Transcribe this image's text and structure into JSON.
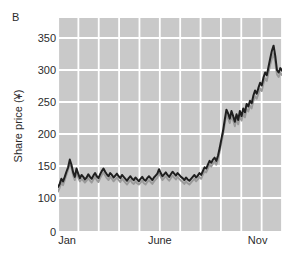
{
  "figure": {
    "panel_label": "B"
  },
  "chart_data": {
    "type": "line",
    "title": "",
    "subtitle": "",
    "xlabel": "",
    "ylabel": "Share price (¥)",
    "currency_symbol": "¥",
    "grid": true,
    "legend": "none",
    "plot_background_color": "#c9c9c9",
    "gridline_color": "#ffffff",
    "axis_text_color": "#2b2b2b",
    "ylim": [
      0,
      370
    ],
    "y_axis_broken": true,
    "y_break_note": "axis jumps from 0 to 100; ticks above 100 are evenly spaced by 50",
    "yticks": [
      0,
      100,
      150,
      200,
      250,
      300,
      350
    ],
    "ytick_labels": [
      "0",
      "100",
      "150",
      "200",
      "250",
      "300",
      "350"
    ],
    "xticks": [
      0,
      5,
      10
    ],
    "xtick_labels": [
      "Jan",
      "June",
      "Nov"
    ],
    "x_axis_unit": "month",
    "x_gridline_count": 11,
    "series": [
      {
        "name": "series-dark",
        "color": "#1f1f1f",
        "values": [
          117,
          122,
          130,
          126,
          133,
          141,
          148,
          160,
          152,
          140,
          133,
          146,
          138,
          131,
          136,
          133,
          129,
          132,
          137,
          133,
          130,
          135,
          139,
          134,
          131,
          137,
          142,
          146,
          141,
          137,
          134,
          139,
          136,
          132,
          135,
          138,
          134,
          131,
          136,
          133,
          130,
          127,
          131,
          134,
          130,
          128,
          132,
          129,
          126,
          130,
          133,
          129,
          127,
          131,
          134,
          131,
          128,
          132,
          135,
          138,
          145,
          139,
          134,
          137,
          140,
          136,
          133,
          137,
          141,
          138,
          135,
          139,
          136,
          133,
          131,
          128,
          132,
          129,
          127,
          130,
          133,
          136,
          132,
          135,
          139,
          136,
          142,
          148,
          146,
          152,
          158,
          155,
          160,
          163,
          158,
          166,
          178,
          192,
          205,
          222,
          238,
          232,
          224,
          236,
          228,
          219,
          231,
          222,
          236,
          228,
          240,
          234,
          247,
          243,
          252,
          248,
          260,
          268,
          263,
          272,
          280,
          276,
          288,
          296,
          292,
          305,
          318,
          330,
          338,
          322,
          300,
          296,
          303,
          299
        ]
      },
      {
        "name": "series-light",
        "color": "#9a9a9a",
        "values": [
          110,
          116,
          124,
          120,
          128,
          136,
          144,
          155,
          147,
          135,
          128,
          140,
          132,
          126,
          130,
          127,
          124,
          127,
          131,
          127,
          124,
          129,
          133,
          128,
          125,
          131,
          136,
          140,
          135,
          131,
          128,
          133,
          130,
          126,
          129,
          132,
          128,
          125,
          130,
          127,
          124,
          121,
          125,
          128,
          124,
          122,
          126,
          123,
          121,
          124,
          127,
          123,
          121,
          125,
          128,
          125,
          122,
          126,
          129,
          132,
          139,
          133,
          128,
          131,
          134,
          130,
          127,
          131,
          135,
          132,
          129,
          133,
          130,
          127,
          125,
          122,
          126,
          123,
          121,
          124,
          127,
          130,
          126,
          129,
          133,
          130,
          136,
          142,
          140,
          146,
          152,
          149,
          154,
          157,
          152,
          160,
          172,
          186,
          199,
          215,
          230,
          224,
          217,
          228,
          221,
          212,
          224,
          215,
          228,
          221,
          232,
          226,
          239,
          235,
          244,
          240,
          252,
          259,
          255,
          263,
          271,
          267,
          279,
          287,
          283,
          296,
          308,
          318,
          326,
          312,
          293,
          289,
          296,
          292
        ]
      }
    ]
  }
}
